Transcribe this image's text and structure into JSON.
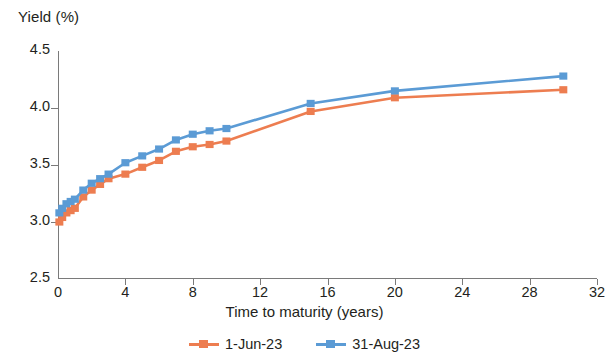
{
  "chart_data": {
    "type": "line",
    "title": "",
    "ylabel": "Yield (%)",
    "xlabel": "Time to maturity (years)",
    "xlim": [
      0,
      32
    ],
    "ylim": [
      2.5,
      4.5
    ],
    "xticks": [
      0,
      4,
      8,
      12,
      16,
      20,
      24,
      28,
      32
    ],
    "yticks": [
      "2.5",
      "3.0",
      "3.5",
      "4.0",
      "4.5"
    ],
    "ytick_values": [
      2.5,
      3.0,
      3.5,
      4.0,
      4.5
    ],
    "grid": false,
    "legend_position": "bottom-center",
    "markers": "square",
    "series": [
      {
        "name": "1-Jun-23",
        "color": "#ED7D50",
        "x": [
          0.08,
          0.25,
          0.5,
          0.75,
          1,
          1.5,
          2,
          2.5,
          3,
          4,
          5,
          6,
          7,
          8,
          9,
          10,
          15,
          20,
          30
        ],
        "y": [
          3.0,
          3.04,
          3.08,
          3.1,
          3.12,
          3.22,
          3.28,
          3.33,
          3.38,
          3.42,
          3.48,
          3.54,
          3.62,
          3.66,
          3.68,
          3.71,
          3.97,
          4.09,
          4.16
        ]
      },
      {
        "name": "31-Aug-23",
        "color": "#5B9BD5",
        "x": [
          0.08,
          0.25,
          0.5,
          0.75,
          1,
          1.5,
          2,
          2.5,
          3,
          4,
          5,
          6,
          7,
          8,
          9,
          10,
          15,
          20,
          30
        ],
        "y": [
          3.08,
          3.12,
          3.16,
          3.18,
          3.2,
          3.28,
          3.34,
          3.38,
          3.42,
          3.52,
          3.58,
          3.64,
          3.72,
          3.77,
          3.8,
          3.82,
          4.04,
          4.15,
          4.28
        ]
      }
    ]
  },
  "legend": {
    "items": [
      {
        "label": "1-Jun-23",
        "color": "#ED7D50"
      },
      {
        "label": "31-Aug-23",
        "color": "#5B9BD5"
      }
    ]
  },
  "axes": {
    "y_title": "Yield (%)",
    "x_title": "Time to maturity (years)"
  }
}
